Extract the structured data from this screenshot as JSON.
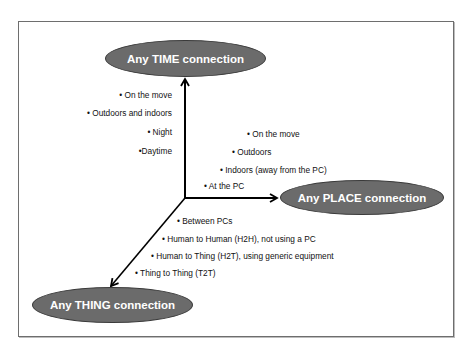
{
  "diagram": {
    "type": "three-axis concept diagram",
    "axes": {
      "time": {
        "title": "Any TIME connection",
        "items": [
          "• On the move",
          "• Outdoors and indoors",
          "• Night",
          "•Daytime"
        ]
      },
      "place": {
        "title": "Any PLACE connection",
        "items": [
          "• On the move",
          "• Outdoors",
          "• Indoors (away from the PC)",
          "• At the PC"
        ]
      },
      "thing": {
        "title": "Any THING connection",
        "items": [
          "• Between PCs",
          "• Human to Human (H2H), not using a PC",
          "• Human to Thing (H2T), using generic equipment",
          "• Thing to Thing (T2T)"
        ]
      }
    },
    "colors": {
      "ellipse_fill": "#6b6b6b",
      "ellipse_text": "#ffffff",
      "arrow": "#000000",
      "frame": "#6e6e6e"
    }
  }
}
